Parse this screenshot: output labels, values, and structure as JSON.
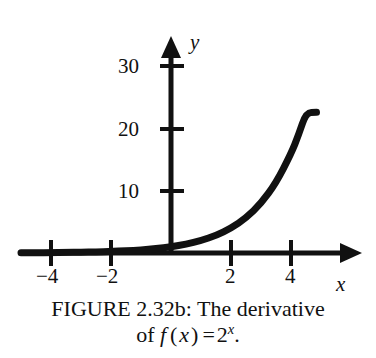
{
  "figure": {
    "caption_line1": "FIGURE 2.32b: The derivative",
    "caption_line2_prefix": "of ",
    "caption_f": "f",
    "caption_paren_open": "(",
    "caption_var": "x",
    "caption_paren_close": ")",
    "caption_equals": "=",
    "caption_base": "2",
    "caption_exponent": "x",
    "caption_period": "."
  },
  "chart_data": {
    "type": "line",
    "xlabel": "x",
    "ylabel": "y",
    "xlim": [
      -5.0,
      5.2
    ],
    "ylim": [
      -1.5,
      33
    ],
    "grid": false,
    "legend": null,
    "x_ticks": [
      -4,
      -2,
      2,
      4
    ],
    "x_tick_labels": [
      "−4",
      "−2",
      "2",
      "4"
    ],
    "y_ticks": [
      10,
      20,
      30
    ],
    "y_tick_labels": [
      "10",
      "20",
      "30"
    ],
    "series": [
      {
        "name": "y = 2^x",
        "x": [
          -5.0,
          -4.5,
          -4.0,
          -3.5,
          -3.0,
          -2.5,
          -2.0,
          -1.5,
          -1.0,
          -0.5,
          0.0,
          0.5,
          1.0,
          1.5,
          2.0,
          2.5,
          3.0,
          3.5,
          4.0,
          4.25,
          4.5,
          4.75,
          4.85
        ],
        "y": [
          0.03,
          0.04,
          0.06,
          0.09,
          0.13,
          0.18,
          0.25,
          0.35,
          0.5,
          0.71,
          1.0,
          1.41,
          2.0,
          2.83,
          4.0,
          5.66,
          8.0,
          11.31,
          16.0,
          19.03,
          22.63,
          26.91,
          22.7
        ]
      }
    ],
    "curve_endpoint": {
      "x": 4.85,
      "y": 22.7
    }
  },
  "axes": {
    "y_axis_label": "y",
    "x_axis_label": "x",
    "x_tick_minus_4": "−4",
    "x_tick_minus_2": "−2",
    "x_tick_2": "2",
    "x_tick_4": "4",
    "y_tick_10": "10",
    "y_tick_20": "20",
    "y_tick_30": "30"
  },
  "style": {
    "ink": "#111111",
    "background": "#ffffff"
  }
}
